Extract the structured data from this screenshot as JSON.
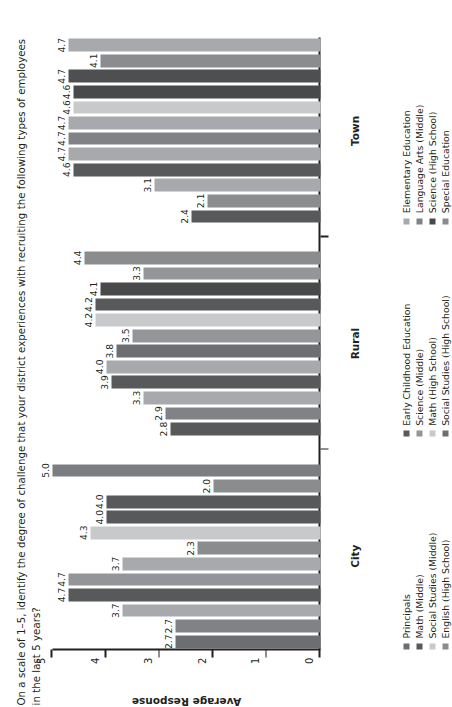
{
  "chart_data": {
    "type": "bar",
    "title": "On a scale of 1–5, identify the degree of challenge that your district experiences with recruiting the following types of employees",
    "title_line2": "in the last 5 years?",
    "xlabel": "",
    "ylabel": "Average Response",
    "ylim": [
      0,
      5
    ],
    "yticks": [
      0,
      1,
      2,
      3,
      4,
      5
    ],
    "ytick_labels": [
      "0",
      "1",
      "2",
      "3",
      "4",
      "5"
    ],
    "grid": false,
    "legend_position": "below-each-group",
    "orientation": "vertical-bars-rotated",
    "groups": [
      {
        "name": "City",
        "label": "City",
        "categories": [
          "Principals",
          "Assistant Principals",
          "Math (Middle)",
          "Science (Middle)",
          "Social Studies (Middle)",
          "Language Arts (Middle)",
          "English (High School)",
          "Math (High School)",
          "Science (High School)",
          "Social Studies (High School)",
          "Special Education",
          "Elementary Education"
        ],
        "values": [
          2.7,
          2.7,
          3.7,
          4.7,
          4.7,
          3.7,
          2.3,
          4.3,
          4.0,
          4.0,
          2.0,
          5.0
        ],
        "value_labels": [
          "2.7",
          "2.7",
          "3.7",
          "4.7",
          "4.7",
          "3.7",
          "2.3",
          "4.3",
          "4.0",
          "4.0",
          "2.0",
          "5.0"
        ],
        "colors": [
          "#6d6e71",
          "#808285",
          "#a7a9ac",
          "#58595b",
          "#939598",
          "#a7a9ac",
          "#8a8c8e",
          "#c7c9cb",
          "#58595b",
          "#58595b",
          "#8a8c8e",
          "#7b7d80"
        ],
        "legend": [
          {
            "label": "Principals",
            "color": "#6d6e71"
          },
          {
            "label": "Math (Middle)",
            "color": "#58595b"
          },
          {
            "label": "Social Studies (Middle)",
            "color": "#c7c9cb"
          },
          {
            "label": "English (High School)",
            "color": "#8a8c8e"
          }
        ]
      },
      {
        "name": "Rural",
        "label": "Rural",
        "categories": [
          "Early Childhood Education",
          "Principals",
          "Language Arts (Middle)",
          "Science (Middle)",
          "Math (Middle)",
          "Social Studies (Middle)",
          "English (High School)",
          "Science (High School)",
          "Math (High School)",
          "Social Studies (High School)",
          "Special Education",
          "Elementary Education"
        ],
        "values": [
          2.8,
          2.9,
          3.3,
          3.9,
          4.0,
          3.8,
          3.5,
          4.2,
          4.2,
          4.1,
          3.3,
          4.4
        ],
        "value_labels": [
          "2.8",
          "2.9",
          "3.3",
          "3.9",
          "4.0",
          "3.8",
          "3.5",
          "4.2",
          "4.2",
          "4.1",
          "3.3",
          "4.4"
        ],
        "colors": [
          "#58595b",
          "#808285",
          "#a7a9ac",
          "#58595b",
          "#a7a9ac",
          "#6d6e71",
          "#939598",
          "#c7c9cb",
          "#58595b",
          "#48494b",
          "#939598",
          "#8a8c8e"
        ],
        "legend": [
          {
            "label": "Early Childhood Education",
            "color": "#58595b"
          },
          {
            "label": "Science (Middle)",
            "color": "#939598"
          },
          {
            "label": "Math (High School)",
            "color": "#c7c9cb"
          },
          {
            "label": "Social Studies (High School)",
            "color": "#6d6e71"
          }
        ]
      },
      {
        "name": "Town",
        "label": "Town",
        "categories": [
          "Special Education",
          "Science (High School)",
          "Math (High School)",
          "Elementary Education",
          "Language Arts (Middle)",
          "Social Studies (Middle)",
          "Science (Middle)",
          "Math (Middle)",
          "Social Studies (High School)",
          "English (High School)",
          "Principals",
          "Early Childhood Education"
        ],
        "values": [
          2.4,
          2.1,
          3.1,
          4.6,
          4.7,
          4.7,
          4.7,
          4.6,
          4.6,
          4.7,
          4.1,
          4.7
        ],
        "value_labels": [
          "2.4",
          "2.1",
          "3.1",
          "4.6",
          "4.7",
          "4.7",
          "4.7",
          "4.6",
          "4.6",
          "4.7",
          "4.1",
          "4.7"
        ],
        "colors": [
          "#58595b",
          "#8a8c8e",
          "#a7a9ac",
          "#58595b",
          "#a7a9ac",
          "#808285",
          "#a7a9ac",
          "#c7c9cb",
          "#48494b",
          "#4e4f51",
          "#8a8c8e",
          "#a7a9ac"
        ],
        "legend": [
          {
            "label": "Elementary Education",
            "color": "#a7a9ac"
          },
          {
            "label": "Language Arts (Middle)",
            "color": "#808285"
          },
          {
            "label": "Science (High School)",
            "color": "#48494b"
          },
          {
            "label": "Special Education",
            "color": "#8a8c8e"
          }
        ]
      }
    ]
  }
}
